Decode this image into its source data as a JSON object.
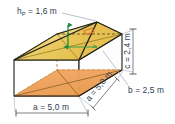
{
  "figure": {
    "background_color": "#ffffff",
    "labels": {
      "pyramid_height": {
        "symbol": "h",
        "subscript": "P",
        "equals": "=",
        "value": "1,6 m",
        "full_text": "hₚ = 1,6 m",
        "position": "top-left",
        "color": "#2d3d52"
      },
      "prism_height": {
        "symbol": "c",
        "equals": "=",
        "value": "2,4 m",
        "full_text": "c = 2,4 m",
        "position": "right-vertical",
        "rotation_deg": -90,
        "color": "#2d3d52"
      },
      "depth": {
        "symbol": "b",
        "equals": "=",
        "value": "2,5 m",
        "full_text": "b = 2,5 m",
        "position": "bottom-right",
        "color": "#2d3d52"
      },
      "width_front": {
        "symbol": "a",
        "equals": "=",
        "value": "5,0 m",
        "full_text": "a = 5,0 m",
        "position": "bottom",
        "color": "#2d3d52"
      },
      "width_side": {
        "symbol": "a",
        "equals": "=",
        "value": "5,0 m",
        "full_text": "a = 5,0 m",
        "position": "bottom-right-diagonal",
        "rotation_deg": -33,
        "color": "#2d3d52"
      }
    },
    "colors": {
      "pyramid_face": "#eccf63",
      "pyramid_face_light": "#f2dd90",
      "base_face": "#f0a55d",
      "base_face_dark": "#e0934a",
      "outline": "#1d1d1b",
      "dimension_line": "#4a4a4a",
      "height_arrow": "#1f8a3c",
      "right_angle_marker": "#e8762c",
      "leader_line": "#9aa7b4",
      "hidden_edge": "#c8802f",
      "text": "#2d3d52"
    },
    "markers": {
      "right_angle": "right-angle-square",
      "height_arrow": "vertical-double-arrow"
    }
  }
}
